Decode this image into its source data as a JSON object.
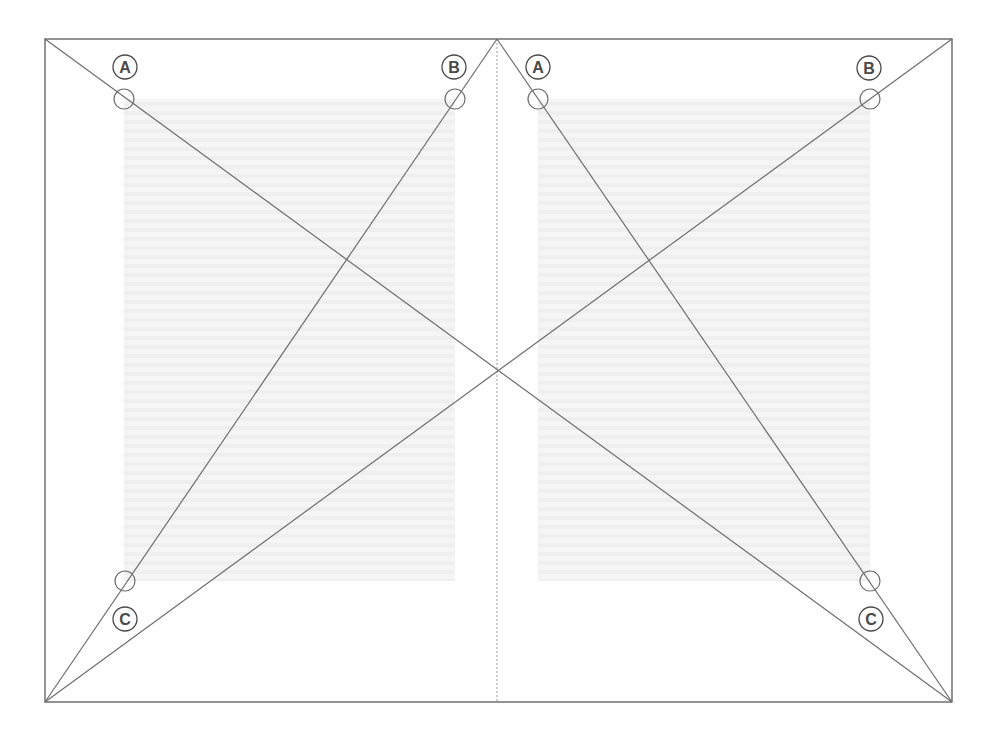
{
  "diagram": {
    "colors": {
      "line": "#6e6e6e",
      "frame": "#5a5a5a",
      "spine": "#9a9a9a",
      "text_block": "#f4f4f4",
      "text_block_lines": "#ececec",
      "label": "#4a4a4a"
    },
    "spread": {
      "x1": 45,
      "y1": 39,
      "x2": 952,
      "y2": 702,
      "spine_x": 497
    },
    "text_blocks": [
      {
        "name": "left-text-block",
        "x": 124,
        "y": 99,
        "w": 331,
        "h": 482
      },
      {
        "name": "right-text-block",
        "x": 538,
        "y": 99,
        "w": 332,
        "h": 482
      }
    ],
    "lines": [
      {
        "name": "spread-diagonal-tl-br",
        "x1": 45,
        "y1": 39,
        "x2": 952,
        "y2": 702
      },
      {
        "name": "spread-diagonal-tr-bl",
        "x1": 952,
        "y1": 39,
        "x2": 45,
        "y2": 702
      },
      {
        "name": "left-page-diagonal",
        "x1": 497,
        "y1": 39,
        "x2": 45,
        "y2": 702
      },
      {
        "name": "right-page-diagonal",
        "x1": 497,
        "y1": 39,
        "x2": 952,
        "y2": 702
      }
    ],
    "markers": [
      {
        "name": "left-a-marker",
        "cx": 124,
        "cy": 99
      },
      {
        "name": "left-b-marker",
        "cx": 455,
        "cy": 99
      },
      {
        "name": "left-c-marker",
        "cx": 125,
        "cy": 581
      },
      {
        "name": "right-a-marker",
        "cx": 538,
        "cy": 99
      },
      {
        "name": "right-b-marker",
        "cx": 870,
        "cy": 99
      },
      {
        "name": "right-c-marker",
        "cx": 870,
        "cy": 581
      }
    ],
    "labels": [
      {
        "name": "left-label-a",
        "text": "A",
        "cx": 125,
        "cy": 67
      },
      {
        "name": "left-label-b",
        "text": "B",
        "cx": 454,
        "cy": 67
      },
      {
        "name": "left-label-c",
        "text": "C",
        "cx": 125,
        "cy": 619
      },
      {
        "name": "right-label-a",
        "text": "A",
        "cx": 538,
        "cy": 67
      },
      {
        "name": "right-label-b",
        "text": "B",
        "cx": 869,
        "cy": 68
      },
      {
        "name": "right-label-c",
        "text": "C",
        "cx": 871,
        "cy": 619
      }
    ]
  }
}
